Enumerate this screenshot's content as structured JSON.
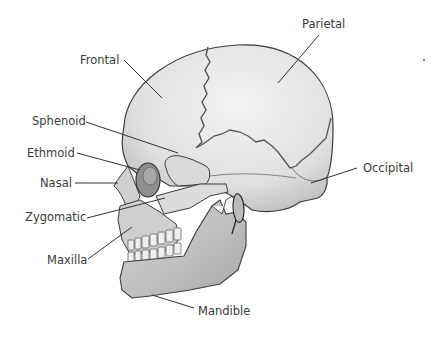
{
  "diagram": {
    "labels": [
      {
        "id": "frontal",
        "text": "Frontal"
      },
      {
        "id": "parietal",
        "text": "Parietal"
      },
      {
        "id": "sphenoid",
        "text": "Sphenoid"
      },
      {
        "id": "ethmoid",
        "text": "Ethmoid"
      },
      {
        "id": "nasal",
        "text": "Nasal"
      },
      {
        "id": "zygomatic",
        "text": "Zygomatic"
      },
      {
        "id": "maxilla",
        "text": "Maxilla"
      },
      {
        "id": "occipital",
        "text": "Occipital"
      },
      {
        "id": "mandible",
        "text": "Mandible"
      }
    ]
  },
  "colors": {
    "background": "#ffffff",
    "bone_fill": "#e4e4e4",
    "bone_shade": "#c9c9c9",
    "outline": "#3c3c3c",
    "label_text": "#3a3a3a",
    "leader_line": "#333333"
  }
}
